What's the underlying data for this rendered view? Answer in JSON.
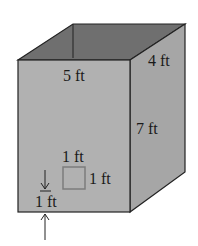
{
  "diagram": {
    "type": "rectangular-prism",
    "colors": {
      "front_face": "#b1b1b1",
      "side_face": "#a6a6a6",
      "top_face": "#6f6f6f",
      "edge": "#222222",
      "window_square": "#7c7c7c",
      "background": "#ffffff"
    },
    "labels": {
      "width": "5 ft",
      "depth": "4 ft",
      "height": "7 ft",
      "square_top": "1 ft",
      "square_side": "1 ft",
      "offset": "1 ft"
    }
  }
}
